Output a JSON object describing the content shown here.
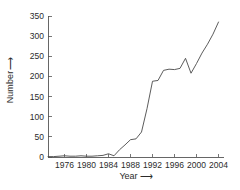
{
  "chart_data": {
    "type": "line",
    "title": "",
    "subtitle": "",
    "xlabel": "Year",
    "xlabel_arrow": "⟶",
    "ylabel": "Number",
    "ylabel_arrow": "⟶",
    "xlim": [
      1973,
      2005
    ],
    "ylim": [
      0,
      350
    ],
    "xticks": [
      1976,
      1980,
      1984,
      1988,
      1992,
      1996,
      2000,
      2004
    ],
    "xtick_labels": [
      "1976",
      "1980",
      "1984",
      "1988",
      "1992",
      "1996",
      "2000",
      "2004"
    ],
    "yticks": [
      0,
      50,
      100,
      150,
      200,
      250,
      300,
      350
    ],
    "ytick_labels": [
      "0",
      "50",
      "100",
      "150",
      "200",
      "250",
      "300",
      "350"
    ],
    "grid": false,
    "legend": false,
    "legend_position": "none",
    "line_color": "#4a4a4a",
    "line_width": 0.9,
    "markers": "none",
    "background": "#ffffff",
    "axis_color": "#555555",
    "series": [
      {
        "name": "Number",
        "x": [
          1973,
          1974,
          1975,
          1976,
          1977,
          1978,
          1979,
          1980,
          1981,
          1982,
          1983,
          1984,
          1985,
          1986,
          1987,
          1988,
          1989,
          1990,
          1991,
          1992,
          1993,
          1994,
          1995,
          1996,
          1997,
          1998,
          1999,
          2000,
          2001,
          2002,
          2003,
          2004
        ],
        "values": [
          1,
          1,
          2,
          3,
          2,
          2,
          3,
          2,
          2,
          3,
          4,
          8,
          3,
          18,
          30,
          43,
          45,
          62,
          120,
          188,
          190,
          215,
          218,
          217,
          220,
          245,
          208,
          232,
          258,
          280,
          305,
          335
        ]
      }
    ]
  }
}
